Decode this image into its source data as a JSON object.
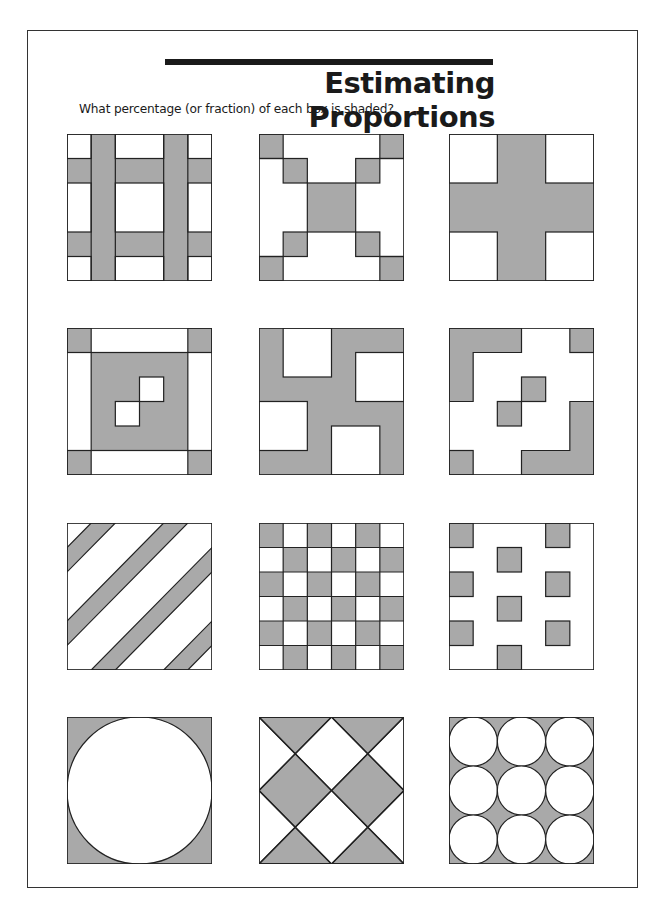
{
  "worksheet": {
    "title": "Estimating Proportions",
    "subtitle": "What percentage (or fraction) of each box is shaded?"
  },
  "colors": {
    "shade": "#a9a9a9",
    "line": "#222222",
    "paper": "#ffffff"
  },
  "boxes": [
    {
      "id": 1,
      "pattern": "tartan-grid",
      "description": "Two horizontal and two vertical shaded bands forming a grid with white squares"
    },
    {
      "id": 2,
      "pattern": "x-squares",
      "description": "Shaded corner squares, diagonal step squares and a central shaded square"
    },
    {
      "id": 3,
      "pattern": "plus-cross",
      "description": "Shaded plus sign with four white corner squares"
    },
    {
      "id": 4,
      "pattern": "framed-center",
      "description": "Shaded central square with two white inner squares, shaded corners and white side strips"
    },
    {
      "id": 5,
      "pattern": "pinwheel",
      "description": "Shaded background with four white squares in pinwheel arrangement"
    },
    {
      "id": 6,
      "pattern": "l-shapes",
      "description": "White background with shaded L shapes, corner squares and two central squares"
    },
    {
      "id": 7,
      "pattern": "diagonal-stripes",
      "description": "Diagonal shaded stripes on white"
    },
    {
      "id": 8,
      "pattern": "checkerboard",
      "description": "6x6 checkerboard, half shaded"
    },
    {
      "id": 9,
      "pattern": "scattered-squares",
      "description": "Nine small shaded squares on white"
    },
    {
      "id": 10,
      "pattern": "inscribed-circle",
      "description": "White circle inscribed in shaded square"
    },
    {
      "id": 11,
      "pattern": "diamonds",
      "description": "Shaded and white diamonds formed by diagonals"
    },
    {
      "id": 12,
      "pattern": "nine-circles",
      "description": "Nine white circles in 3x3 grid on shaded square"
    }
  ]
}
